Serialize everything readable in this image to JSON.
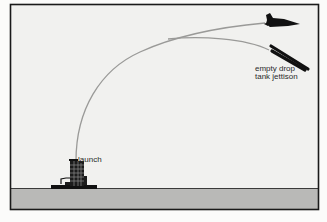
{
  "diagram": {
    "type": "trajectory-illustration",
    "colors": {
      "sky": "#f1f1ef",
      "ground": "#b9b9b7",
      "frame": "#1a1a1a",
      "trajectory": "#9a9a98",
      "silhouette": "#111111"
    },
    "labels": {
      "launch": "launch",
      "jettison_line1": "empty drop",
      "jettison_line2": "tank jettison"
    },
    "elements": {
      "launch_tower": "launch-tower",
      "orbiter": "space-shuttle-orbiter",
      "drop_tank": "empty-drop-tank"
    }
  }
}
